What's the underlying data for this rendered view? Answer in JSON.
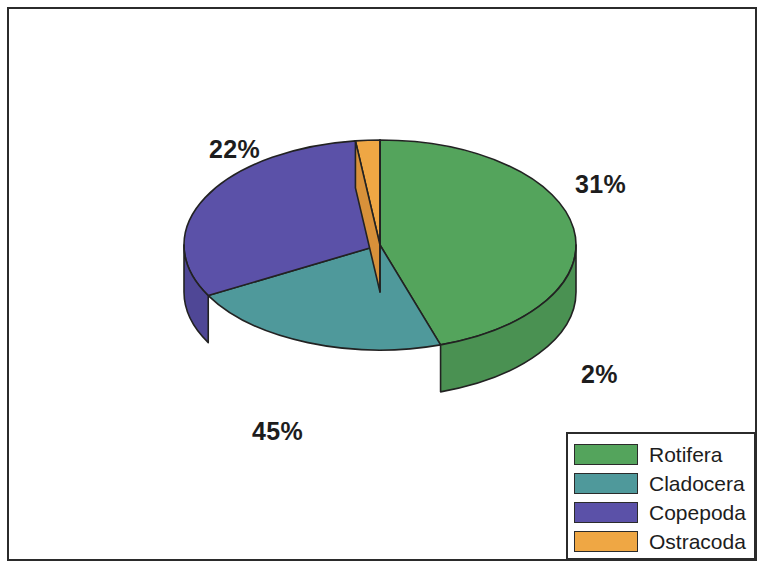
{
  "figure": {
    "background_color": "#ffffff",
    "frame_color": "#2b2b2b",
    "label_color": "#1d1d1d"
  },
  "chart_data": {
    "type": "pie",
    "title": "",
    "subtitle": "",
    "xlabel": "",
    "ylabel": "",
    "three_d": true,
    "legend_position": "bottom-right",
    "grid": false,
    "start_angle_deg": 90,
    "direction": "clockwise",
    "categories": [
      "Rotifera",
      "Cladocera",
      "Copepoda",
      "Ostracoda"
    ],
    "values": [
      45,
      22,
      31,
      2
    ],
    "value_unit": "%",
    "data_labels": [
      "45%",
      "22%",
      "31%",
      "2%"
    ],
    "colors": [
      "#54a45c",
      "#4f999b",
      "#5b51a8",
      "#efa744"
    ],
    "side_colors": [
      "#4a9152",
      "#45868a",
      "#4f4796",
      "#d8913a"
    ],
    "slices": [
      {
        "label": "Rotifera",
        "value": 45,
        "percent_text": "45%",
        "color": "#54a45c"
      },
      {
        "label": "Cladocera",
        "value": 22,
        "percent_text": "22%",
        "color": "#4f999b"
      },
      {
        "label": "Copepoda",
        "value": 31,
        "percent_text": "31%",
        "color": "#5b51a8"
      },
      {
        "label": "Ostracoda",
        "value": 2,
        "percent_text": "2%",
        "color": "#efa744"
      }
    ]
  },
  "labels": {
    "cladocera_pct": "22%",
    "copepoda_pct": "31%",
    "ostracoda_pct": "2%",
    "rotifera_pct": "45%"
  },
  "legend": {
    "items": [
      {
        "label": "Rotifera",
        "color": "#54a45c"
      },
      {
        "label": "Cladocera",
        "color": "#4f999b"
      },
      {
        "label": "Copepoda",
        "color": "#5b51a8"
      },
      {
        "label": "Ostracoda",
        "color": "#efa744"
      }
    ]
  }
}
